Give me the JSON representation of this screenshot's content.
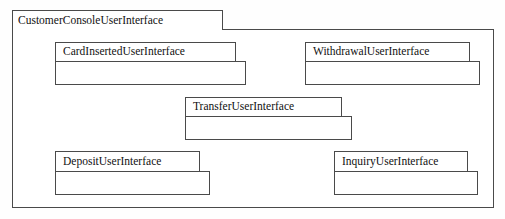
{
  "diagram": {
    "type": "uml-package-diagram",
    "background_color": "#fefefe",
    "line_color": "#4a4a4a",
    "text_color": "#111111",
    "package": {
      "name": "CustomerConsoleUserInterface",
      "tab": {
        "x": 12,
        "y": 10,
        "w": 211,
        "h": 20
      },
      "body": {
        "x": 12,
        "y": 29,
        "w": 482,
        "h": 179
      }
    },
    "classes": [
      {
        "name": "CardInsertedUserInterface",
        "header": {
          "x": 55,
          "y": 42,
          "w": 181,
          "h": 20
        },
        "body": {
          "x": 55,
          "y": 61,
          "w": 191,
          "h": 24
        }
      },
      {
        "name": "WithdrawalUserInterface",
        "header": {
          "x": 305,
          "y": 42,
          "w": 165,
          "h": 20
        },
        "body": {
          "x": 305,
          "y": 61,
          "w": 175,
          "h": 24
        }
      },
      {
        "name": "TransferUserInterface",
        "header": {
          "x": 185,
          "y": 97,
          "w": 157,
          "h": 20
        },
        "body": {
          "x": 185,
          "y": 116,
          "w": 167,
          "h": 24
        }
      },
      {
        "name": "DepositUserInterface",
        "header": {
          "x": 55,
          "y": 151,
          "w": 145,
          "h": 21
        },
        "body": {
          "x": 55,
          "y": 171,
          "w": 155,
          "h": 24
        }
      },
      {
        "name": "InquiryUserInterface",
        "header": {
          "x": 334,
          "y": 151,
          "w": 134,
          "h": 21
        },
        "body": {
          "x": 334,
          "y": 171,
          "w": 144,
          "h": 24
        }
      }
    ]
  }
}
